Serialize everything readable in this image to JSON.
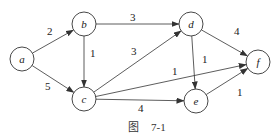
{
  "graph": {
    "nodes": [
      {
        "id": "a",
        "label": "a",
        "x": 22,
        "y": 59
      },
      {
        "id": "b",
        "label": "b",
        "x": 84,
        "y": 24
      },
      {
        "id": "c",
        "label": "c",
        "x": 84,
        "y": 99
      },
      {
        "id": "d",
        "label": "d",
        "x": 191,
        "y": 24
      },
      {
        "id": "e",
        "label": "e",
        "x": 196,
        "y": 101
      },
      {
        "id": "f",
        "label": "f",
        "x": 258,
        "y": 62
      }
    ],
    "edges": [
      {
        "from": "a",
        "to": "b",
        "weight": "2",
        "lx": 47,
        "ly": 35
      },
      {
        "from": "a",
        "to": "c",
        "weight": "5",
        "lx": 45,
        "ly": 90
      },
      {
        "from": "b",
        "to": "c",
        "weight": "1",
        "lx": 90,
        "ly": 57
      },
      {
        "from": "b",
        "to": "d",
        "weight": "3",
        "lx": 130,
        "ly": 21
      },
      {
        "from": "c",
        "to": "d",
        "weight": "3",
        "lx": 131,
        "ly": 55
      },
      {
        "from": "c",
        "to": "f",
        "weight": "1",
        "lx": 172,
        "ly": 75
      },
      {
        "from": "c",
        "to": "e",
        "weight": "4",
        "lx": 138,
        "ly": 112
      },
      {
        "from": "d",
        "to": "f",
        "weight": "4",
        "lx": 234,
        "ly": 35
      },
      {
        "from": "d",
        "to": "e",
        "weight": "1",
        "lx": 202,
        "ly": 63
      },
      {
        "from": "e",
        "to": "f",
        "weight": "1",
        "lx": 237,
        "ly": 96
      }
    ]
  },
  "caption": {
    "figure": "图",
    "number": "7-1"
  }
}
